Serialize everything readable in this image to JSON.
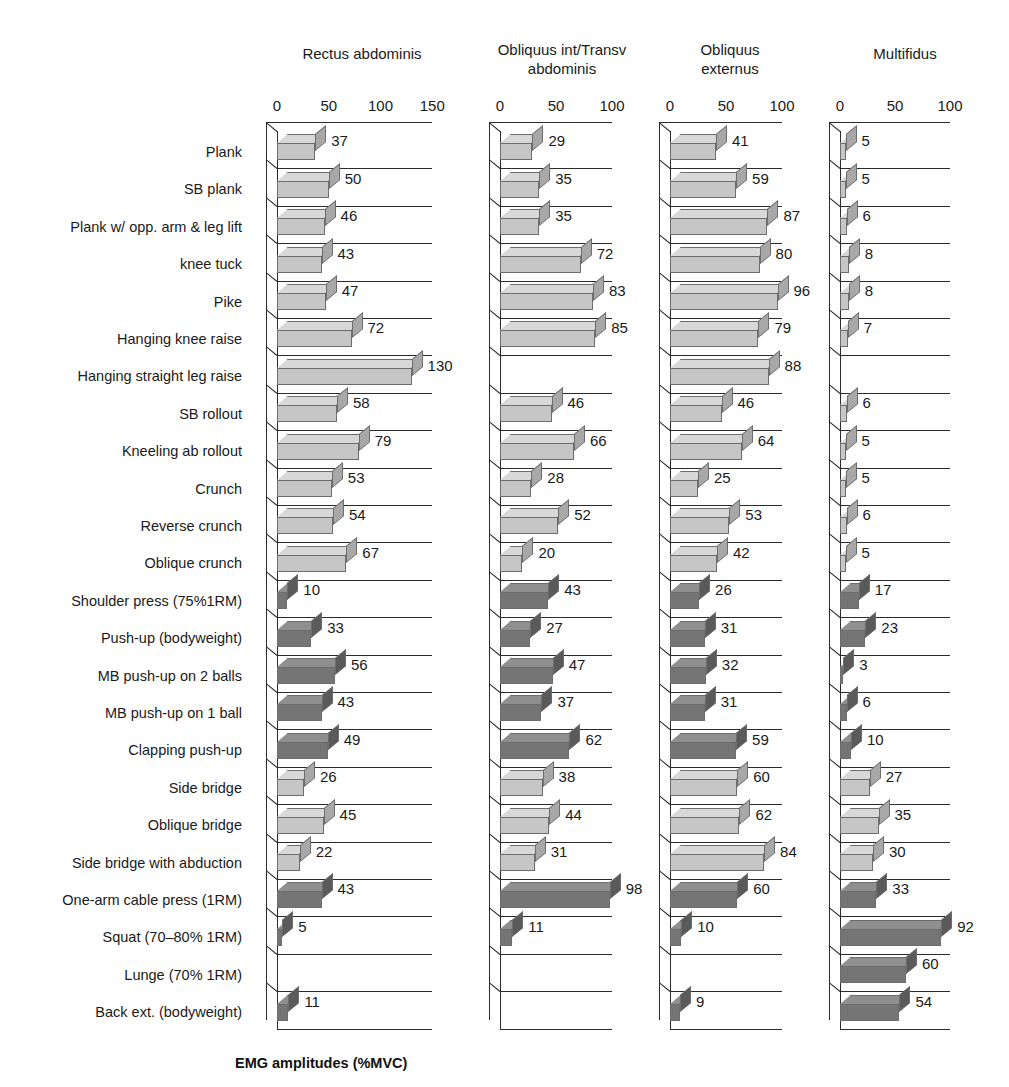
{
  "figure": {
    "caption": "EMG amplitudes (%MVC)"
  },
  "chart_data": {
    "type": "bar",
    "title": "EMG amplitudes (%MVC)",
    "orientation": "horizontal",
    "xlabel": "EMG amplitudes (%MVC)",
    "ylabel": "",
    "grid": true,
    "legend": "none",
    "categories": [
      "Plank",
      "SB plank",
      "Plank w/ opp. arm & leg lift",
      "knee tuck",
      "Pike",
      "Hanging knee raise",
      "Hanging straight leg raise",
      "SB rollout",
      "Kneeling ab rollout",
      "Crunch",
      "Reverse crunch",
      "Oblique crunch",
      "Shoulder press (75%1RM)",
      "Push-up (bodyweight)",
      "MB push-up on 2 balls",
      "MB push-up on 1 ball",
      "Clapping push-up",
      "Side bridge",
      "Oblique bridge",
      "Side bridge with abduction",
      "One-arm cable press (1RM)",
      "Squat (70–80% 1RM)",
      "Lunge (70% 1RM)",
      "Back ext. (bodyweight)"
    ],
    "panels": [
      {
        "name": "Rectus abdominis",
        "title_lines": "Rectus abdominis",
        "xlim": [
          0,
          150
        ],
        "ticks": [
          0,
          50,
          100,
          150
        ],
        "values": [
          37,
          50,
          46,
          43,
          47,
          72,
          130,
          58,
          79,
          53,
          54,
          67,
          10,
          33,
          56,
          43,
          49,
          26,
          45,
          22,
          43,
          5,
          null,
          11
        ]
      },
      {
        "name": "Obliquus int/Transv abdominis",
        "title_lines": "Obliquus int/Transv\nabdominis",
        "xlim": [
          0,
          100
        ],
        "ticks": [
          0,
          50,
          100
        ],
        "values": [
          29,
          35,
          35,
          72,
          83,
          85,
          null,
          46,
          66,
          28,
          52,
          20,
          43,
          27,
          47,
          37,
          62,
          38,
          44,
          31,
          98,
          11,
          null,
          null
        ]
      },
      {
        "name": "Obliquus externus",
        "title_lines": "Obliquus\nexternus",
        "xlim": [
          0,
          100
        ],
        "ticks": [
          0,
          50,
          100
        ],
        "values": [
          41,
          59,
          87,
          80,
          96,
          79,
          88,
          46,
          64,
          25,
          53,
          42,
          26,
          31,
          32,
          31,
          59,
          60,
          62,
          84,
          60,
          10,
          null,
          9
        ]
      },
      {
        "name": "Multifidus",
        "title_lines": "Multifidus",
        "xlim": [
          0,
          100
        ],
        "ticks": [
          0,
          50,
          100
        ],
        "values": [
          5,
          5,
          6,
          8,
          8,
          7,
          null,
          6,
          5,
          5,
          6,
          5,
          17,
          23,
          3,
          6,
          10,
          27,
          35,
          30,
          33,
          92,
          60,
          54
        ]
      }
    ],
    "shading": {
      "light": "#c9c9c9",
      "dark": "#7a7a7a",
      "row_shade": [
        "light",
        "light",
        "light",
        "light",
        "light",
        "light",
        "light",
        "light",
        "light",
        "light",
        "light",
        "light",
        "dark",
        "dark",
        "dark",
        "dark",
        "dark",
        "light",
        "light",
        "light",
        "dark",
        "dark",
        "dark",
        "dark"
      ]
    }
  }
}
